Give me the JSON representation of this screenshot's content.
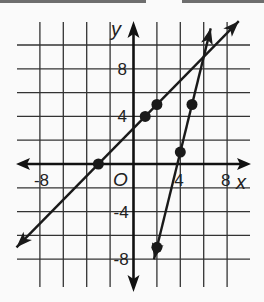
{
  "chart_data": {
    "type": "line",
    "title": "",
    "xlabel": "x",
    "ylabel": "y",
    "origin_label": "O",
    "xlim": [
      -10,
      10
    ],
    "ylim": [
      -10,
      12
    ],
    "grid": true,
    "grid_step": 2,
    "x_ticks": [
      {
        "value": -8,
        "label": "-8"
      },
      {
        "value": 4,
        "label": "4"
      },
      {
        "value": 8,
        "label": "8"
      }
    ],
    "y_ticks": [
      {
        "value": 8,
        "label": "8"
      },
      {
        "value": 4,
        "label": "4"
      },
      {
        "value": -4,
        "label": "-4"
      },
      {
        "value": -8,
        "label": "-8"
      }
    ],
    "series": [
      {
        "name": "line-1",
        "equation": "y = x + 3",
        "slope": 1,
        "intercept": 3,
        "x_range": [
          -10,
          9
        ],
        "points": [
          [
            -3,
            0
          ],
          [
            1,
            4
          ],
          [
            2,
            5
          ]
        ]
      },
      {
        "name": "line-2",
        "equation": "y = 4x - 15",
        "slope": 4,
        "intercept": -15,
        "x_range": [
          1.75,
          6.6
        ],
        "points": [
          [
            2,
            -7
          ],
          [
            4,
            1
          ],
          [
            5,
            5
          ]
        ]
      }
    ],
    "line_color": "#1a1a1a",
    "grid_color": "#333333"
  }
}
